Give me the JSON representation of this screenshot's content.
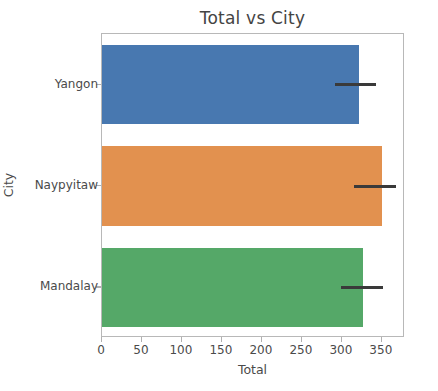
{
  "chart_data": {
    "type": "bar",
    "orientation": "horizontal",
    "title": "Total vs City",
    "xlabel": "Total",
    "ylabel": "City",
    "categories": [
      "Yangon",
      "Naypyitaw",
      "Mandalay"
    ],
    "values": [
      321,
      350,
      327
    ],
    "error_low": [
      291,
      315,
      299
    ],
    "error_high": [
      343,
      368,
      351
    ],
    "xlim": [
      0,
      379
    ],
    "xticks": [
      0,
      50,
      100,
      150,
      200,
      250,
      300,
      350
    ],
    "xtick_labels": [
      "0",
      "50",
      "100",
      "150",
      "200",
      "250",
      "300",
      "350"
    ],
    "grid": false,
    "legend": "none",
    "bar_colors": [
      "#4878b0",
      "#e2914f",
      "#55a868"
    ],
    "error_color": "#3a3a3a",
    "series": [
      {
        "name": "Total",
        "points": [
          {
            "category": "Yangon",
            "value": 321,
            "ci_low": 291,
            "ci_high": 343,
            "color": "#4878b0"
          },
          {
            "category": "Naypyitaw",
            "value": 350,
            "ci_low": 315,
            "ci_high": 368,
            "color": "#e2914f"
          },
          {
            "category": "Mandalay",
            "value": 327,
            "ci_low": 299,
            "ci_high": 351,
            "color": "#55a868"
          }
        ]
      }
    ]
  }
}
